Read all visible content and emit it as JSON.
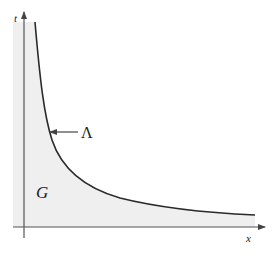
{
  "figure": {
    "labels": {
      "y_axis": "t",
      "x_axis": "x",
      "curve": "Λ",
      "region": "G"
    },
    "colors": {
      "region_fill": "#efefef",
      "curve": "#2a2a2a",
      "axis": "#555555"
    }
  }
}
